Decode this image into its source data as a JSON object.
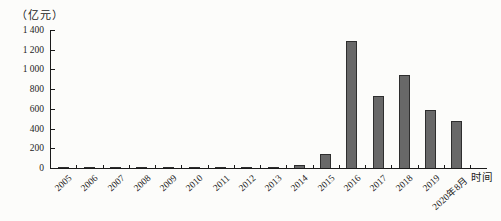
{
  "chart_data": {
    "type": "bar",
    "title": "",
    "unit_label": "（亿元）",
    "xlabel": "时间",
    "ylabel": "（亿元）",
    "categories": [
      "2005",
      "2006",
      "2007",
      "2008",
      "2009",
      "2010",
      "2011",
      "2012",
      "2013",
      "2014",
      "2015",
      "2016",
      "2017",
      "2018",
      "2019",
      "2020年8月"
    ],
    "values": [
      15,
      10,
      2,
      2,
      15,
      2,
      2,
      3,
      8,
      30,
      140,
      1290,
      730,
      940,
      590,
      475
    ],
    "ylim": [
      0,
      1400
    ],
    "yticks": [
      0,
      200,
      400,
      600,
      800,
      1000,
      1200,
      1400
    ],
    "ytick_labels": [
      "0",
      "200",
      "400",
      "600",
      "800",
      "1 000",
      "1 200",
      "1 400"
    ],
    "grid": false,
    "legend": "none",
    "colors": {
      "bar_fill": "#686868",
      "bar_border": "#2e2e2e",
      "axis": "#1a1a1a",
      "text": "#1c1c1c",
      "background": "#fcfcfa"
    }
  }
}
